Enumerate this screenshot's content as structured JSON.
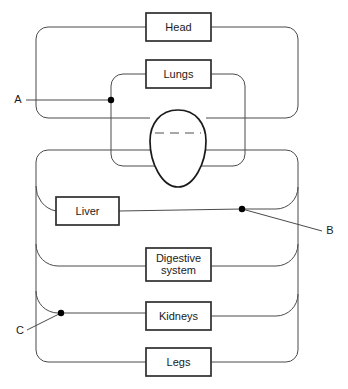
{
  "diagram": {
    "background_color": "#ffffff",
    "vessel_color": "#4a4a4a",
    "box_stroke_color": "#2e2e2e",
    "heart_stroke_color": "#1a1a1a",
    "septum_color": "#8a8a8a",
    "marker_color": "#000000",
    "organs": [
      {
        "id": "head",
        "label": "Head",
        "x": 146,
        "y": 13,
        "w": 65,
        "h": 28
      },
      {
        "id": "lungs",
        "label": "Lungs",
        "x": 146,
        "y": 60,
        "w": 65,
        "h": 28
      },
      {
        "id": "liver",
        "label": "Liver",
        "x": 56,
        "y": 197,
        "w": 63,
        "h": 28
      },
      {
        "id": "digestive",
        "label": "Digestive",
        "label2": "system",
        "x": 146,
        "y": 248,
        "w": 65,
        "h": 33
      },
      {
        "id": "kidneys",
        "label": "Kidneys",
        "x": 146,
        "y": 302,
        "w": 65,
        "h": 28
      },
      {
        "id": "legs",
        "label": "Legs",
        "x": 146,
        "y": 348,
        "w": 65,
        "h": 28
      }
    ],
    "markers": [
      {
        "id": "a",
        "label": "A",
        "dot_x": 111,
        "dot_y": 100,
        "label_x": 18,
        "label_y": 100
      },
      {
        "id": "b",
        "label": "B",
        "dot_x": 242,
        "dot_y": 209,
        "label_x": 330,
        "label_y": 231
      },
      {
        "id": "c",
        "label": "C",
        "dot_x": 61,
        "dot_y": 313,
        "label_x": 20,
        "label_y": 331
      }
    ],
    "heart": {
      "id": "heart",
      "label": "heart",
      "center_x": 178,
      "top_y": 110,
      "bottom_y": 187,
      "half_width": 28,
      "septum_y": 133
    }
  }
}
